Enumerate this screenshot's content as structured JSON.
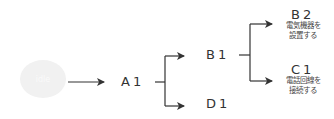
{
  "diagram": {
    "start": {
      "label": "idle"
    },
    "nodes": {
      "a1": {
        "label": "A1"
      },
      "b1": {
        "label": "B1"
      },
      "d1": {
        "label": "D1"
      },
      "b2": {
        "label": "B2",
        "line1": "電気機器を",
        "line2": "設置する"
      },
      "c1": {
        "label": "C1",
        "line1": "電話回線を",
        "line2": "接続する"
      }
    },
    "colors": {
      "line": "#333333",
      "blob": "#f1f1f1"
    }
  }
}
